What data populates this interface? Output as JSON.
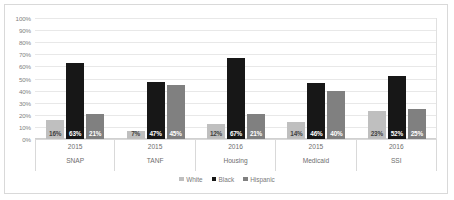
{
  "chart_data": {
    "type": "bar",
    "title": "",
    "subtitle": "",
    "xlabel": "",
    "ylabel": "",
    "ylim": [
      0,
      100
    ],
    "y_tick_labels": [
      "100%",
      "90%",
      "80%",
      "70%",
      "60%",
      "50%",
      "40%",
      "30%",
      "20%",
      "10%",
      "0%"
    ],
    "y_tick_values": [
      100,
      90,
      80,
      70,
      60,
      50,
      40,
      30,
      20,
      10,
      0
    ],
    "grid": true,
    "legend_position": "bottom",
    "categories": [
      "SNAP",
      "TANF",
      "Housing",
      "Medicaid",
      "SSI"
    ],
    "category_years": [
      "2015",
      "2015",
      "2016",
      "2015",
      "2016"
    ],
    "series": [
      {
        "name": "White",
        "color": "#bfbfbf",
        "values": [
          16,
          7,
          12,
          14,
          23
        ],
        "labels": [
          "16%",
          "7%",
          "12%",
          "14%",
          "23%"
        ]
      },
      {
        "name": "Black",
        "color": "#171717",
        "values": [
          63,
          47,
          67,
          46,
          52
        ],
        "labels": [
          "63%",
          "47%",
          "67%",
          "46%",
          "52%"
        ]
      },
      {
        "name": "Hispanic",
        "color": "#808080",
        "values": [
          21,
          45,
          21,
          40,
          25
        ],
        "labels": [
          "21%",
          "45%",
          "21%",
          "40%",
          "25%"
        ]
      }
    ]
  },
  "legend": {
    "items": [
      {
        "label": "White",
        "color": "#bfbfbf"
      },
      {
        "label": "Black",
        "color": "#171717"
      },
      {
        "label": "Hispanic",
        "color": "#808080"
      }
    ]
  },
  "colors": {
    "white_series": "#bfbfbf",
    "black_series": "#171717",
    "hispanic_series": "#808080",
    "gridline": "#e8e8e8",
    "frame_border": "#d9d9d9",
    "axis_text": "#7f7f7f"
  }
}
